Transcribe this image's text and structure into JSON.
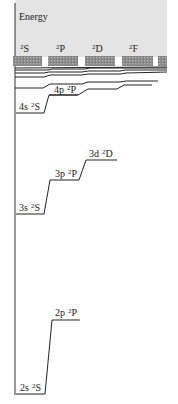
{
  "axis": {
    "label": "Energy"
  },
  "columns": [
    {
      "id": "S",
      "label": "S",
      "multiplicity": "2",
      "x": 14
    },
    {
      "id": "P",
      "label": "P",
      "multiplicity": "2",
      "x": 49
    },
    {
      "id": "D",
      "label": "D",
      "multiplicity": "2",
      "x": 86
    },
    {
      "id": "F",
      "label": "F",
      "multiplicity": "2",
      "x": 123
    }
  ],
  "levels": [
    {
      "name": "2s",
      "term": "S",
      "mult": "2",
      "label": "2s",
      "y": 394,
      "x1": 16,
      "x2": 45
    },
    {
      "name": "2p",
      "term": "P",
      "mult": "2",
      "label": "2p",
      "y": 320,
      "x1": 52,
      "x2": 80
    },
    {
      "name": "3s",
      "term": "S",
      "mult": "2",
      "label": "3s",
      "y": 214,
      "x1": 16,
      "x2": 44
    },
    {
      "name": "3p",
      "term": "P",
      "mult": "2",
      "label": "3p",
      "y": 180,
      "x1": 50,
      "x2": 79
    },
    {
      "name": "3d",
      "term": "D",
      "mult": "2",
      "label": "3d",
      "y": 160,
      "x1": 86,
      "x2": 117
    },
    {
      "name": "4s",
      "term": "S",
      "mult": "2",
      "label": "4s",
      "y": 113,
      "x1": 16,
      "x2": 44
    },
    {
      "name": "4p",
      "term": "P",
      "mult": "2",
      "label": "4p",
      "y": 95,
      "x1": 49,
      "x2": 78
    }
  ],
  "colors": {
    "background_band": "#e4e4e4",
    "hatch": "#8a8a8a",
    "line": "#222222"
  }
}
